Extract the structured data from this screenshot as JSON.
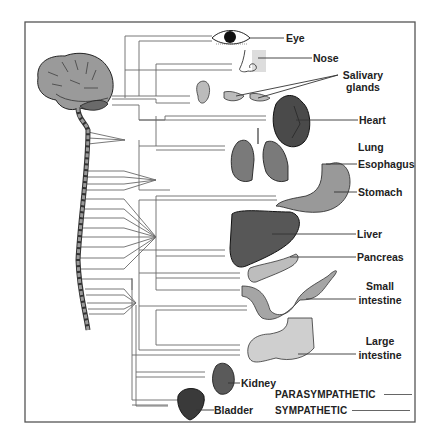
{
  "colors": {
    "frame": "#555555",
    "nerve_line": "#6a6a6a",
    "organ_dark": "#5c5c5c",
    "organ_mid": "#8a8a8a",
    "organ_light": "#c8c8c8",
    "brain": "#9a9a9a",
    "text": "#222222"
  },
  "labels": {
    "eye": "Eye",
    "nose": "Nose",
    "salivary_1": "Salivary",
    "salivary_2": "glands",
    "heart": "Heart",
    "lung": "Lung",
    "esophagus": "Esophagus",
    "stomach": "Stomach",
    "liver": "Liver",
    "pancreas": "Pancreas",
    "small_intestine_1": "Small",
    "small_intestine_2": "intestine",
    "large_intestine_1": "Large",
    "large_intestine_2": "intestine",
    "kidney": "Kidney",
    "bladder": "Bladder"
  },
  "legend": {
    "parasympathetic": "PARASYMPATHETIC",
    "sympathetic": "SYMPATHETIC"
  },
  "structures": [
    "brain",
    "spinal-cord",
    "eye",
    "nose",
    "salivary-glands",
    "heart",
    "lungs",
    "esophagus",
    "stomach",
    "liver",
    "pancreas",
    "small-intestine",
    "large-intestine",
    "kidney",
    "bladder"
  ]
}
